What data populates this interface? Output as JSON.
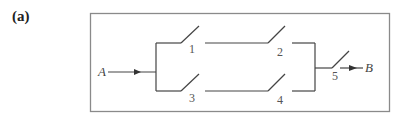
{
  "panel_label": "(a)",
  "diagram": {
    "type": "switch-network",
    "input_node": "A",
    "output_node": "B",
    "switches": [
      {
        "id": "1",
        "label": "1",
        "branch": "top",
        "position": 1
      },
      {
        "id": "2",
        "label": "2",
        "branch": "top",
        "position": 2
      },
      {
        "id": "3",
        "label": "3",
        "branch": "bottom",
        "position": 1
      },
      {
        "id": "4",
        "label": "4",
        "branch": "bottom",
        "position": 2
      },
      {
        "id": "5",
        "label": "5",
        "branch": "output",
        "position": 1
      }
    ],
    "topology": "((1 series 2) parallel (3 series 4)) series 5"
  },
  "colors": {
    "line": "#444444",
    "border": "#888888",
    "text": "#444444"
  }
}
